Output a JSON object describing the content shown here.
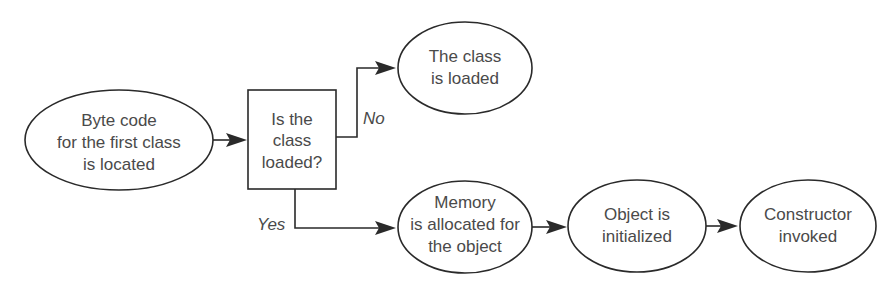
{
  "nodes": {
    "bytecode": {
      "shape": "ellipse",
      "lines": [
        "Byte code",
        "for the first class",
        "is located"
      ]
    },
    "decision": {
      "shape": "rectangle",
      "lines": [
        "Is the",
        "class",
        "loaded?"
      ]
    },
    "class_loaded": {
      "shape": "ellipse",
      "lines": [
        "The class",
        "is loaded"
      ]
    },
    "memory": {
      "shape": "ellipse",
      "lines": [
        "Memory",
        "is allocated for",
        "the object"
      ]
    },
    "initialized": {
      "shape": "ellipse",
      "lines": [
        "Object is",
        "initialized"
      ]
    },
    "constructor": {
      "shape": "ellipse",
      "lines": [
        "Constructor",
        "invoked"
      ]
    }
  },
  "edges": {
    "no_label": "No",
    "yes_label": "Yes"
  },
  "colors": {
    "stroke": "#2a2a2a",
    "text": "#4a4a4a",
    "background": "#ffffff"
  }
}
